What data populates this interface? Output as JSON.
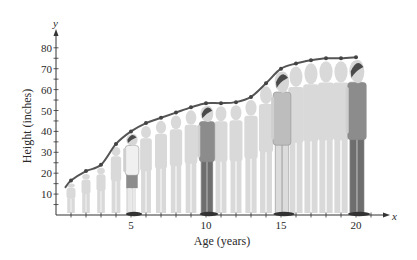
{
  "chart_data": {
    "type": "line",
    "title": "",
    "xlabel": "Age (years)",
    "ylabel": "Height (inches)",
    "x_axis_var": "x",
    "y_axis_var": "y",
    "xlim": [
      0,
      22
    ],
    "ylim": [
      0,
      85
    ],
    "x_ticks": [
      5,
      10,
      15,
      20
    ],
    "y_ticks": [
      10,
      20,
      30,
      40,
      50,
      60,
      70,
      80
    ],
    "x_minor_tick_step": 1,
    "y_minor_tick_step": 5,
    "grid": false,
    "legend": null,
    "series": [
      {
        "name": "Height",
        "x": [
          0.6,
          1,
          2,
          3,
          4,
          5,
          6,
          7,
          8,
          9,
          10,
          11,
          12,
          13,
          14,
          15,
          16,
          17,
          18,
          19,
          20
        ],
        "values": [
          13,
          16.5,
          21,
          24,
          34,
          40,
          44,
          46.5,
          49,
          51.5,
          53.5,
          53.5,
          54,
          56.5,
          63,
          70,
          72.5,
          74,
          75,
          75,
          75.5
        ],
        "color": "#555555"
      }
    ],
    "annotations": [
      "Background illustration: a boy's silhouettes at each age, with highlighted figures at ages 5, 10, 15 and 20"
    ],
    "highlighted_ages": [
      5,
      10,
      15,
      20
    ]
  },
  "colors": {
    "axis": "#333333",
    "curve": "#555555",
    "silhouette": "#d9d9d9",
    "figure_dark": "#6e6e6e",
    "figure_mid": "#8c8c8c",
    "hair": "#4a4a4a"
  }
}
